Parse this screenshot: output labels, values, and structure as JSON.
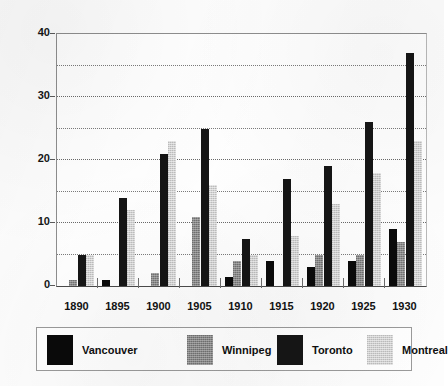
{
  "chart_data": {
    "type": "bar",
    "title": "",
    "subtitle": "",
    "xlabel": "",
    "ylabel": "",
    "categories": [
      "1890",
      "1895",
      "1900",
      "1905",
      "1910",
      "1915",
      "1920",
      "1925",
      "1930"
    ],
    "series": [
      {
        "name": "Vancouver",
        "color": "#0a0a0a",
        "values": [
          0,
          1,
          0,
          0,
          1.5,
          4,
          3,
          4,
          9
        ]
      },
      {
        "name": "Winnipeg",
        "color": "#8a8a8a",
        "values": [
          1,
          0,
          2,
          11,
          4,
          0,
          5,
          5,
          7
        ]
      },
      {
        "name": "Toronto",
        "color": "#151515",
        "values": [
          5,
          14,
          21,
          25,
          7.5,
          17,
          19,
          26,
          37
        ]
      },
      {
        "name": "Montreal",
        "color": "#d2d2d2",
        "values": [
          5,
          12,
          23,
          16,
          5,
          8,
          13,
          18,
          23
        ]
      }
    ],
    "ylim": [
      0,
      40
    ],
    "y_major_ticks": [
      0,
      10,
      20,
      30,
      40
    ],
    "y_major_tick_labels": [
      "0",
      "10",
      "20",
      "30",
      "40"
    ],
    "y_gridline_values": [
      5,
      10,
      15,
      20,
      25,
      30,
      35
    ],
    "grid": "dotted-horizontal",
    "legend_position": "bottom",
    "legend_entries": [
      "Vancouver",
      "Winnipeg",
      "Toronto",
      "Montreal"
    ]
  }
}
